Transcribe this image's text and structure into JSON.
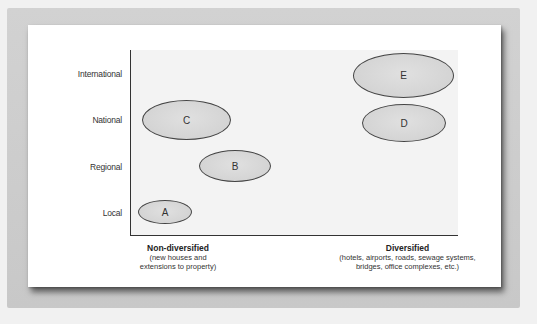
{
  "diagram": {
    "type": "positioning-map",
    "y_axis": {
      "labels": [
        "International",
        "National",
        "Regional",
        "Local"
      ]
    },
    "x_axis": {
      "left": {
        "title": "Non-diversified",
        "subtitle_line1": "(new houses and",
        "subtitle_line2": "extensions to property)"
      },
      "right": {
        "title": "Diversified",
        "subtitle_line1": "(hotels, airports, roads, sewage systems,",
        "subtitle_line2": "bridges, office complexes, etc.)"
      }
    },
    "nodes": [
      {
        "label": "A",
        "level": "Local",
        "diversification": "Non-diversified"
      },
      {
        "label": "B",
        "level": "Regional",
        "diversification": "Slightly diversified"
      },
      {
        "label": "C",
        "level": "National",
        "diversification": "Non-diversified"
      },
      {
        "label": "D",
        "level": "National",
        "diversification": "Diversified"
      },
      {
        "label": "E",
        "level": "International",
        "diversification": "Diversified"
      }
    ],
    "colors": {
      "ellipse_fill": "#d6d6d6",
      "ellipse_stroke": "#444444",
      "plot_background": "#f3f3f3",
      "axis": "#333333",
      "frame": "#cccccc"
    }
  }
}
